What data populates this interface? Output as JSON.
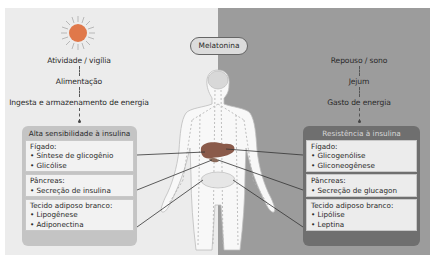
{
  "left_panel": {
    "icon": "sun-icon",
    "labels": [
      "Atividade / vigília",
      "Alimentação",
      "Ingesta e armazenamento de energia"
    ],
    "group": {
      "title": "Alta sensibilidade à insulina",
      "boxes": [
        {
          "heading": "Fígado:",
          "items": [
            "Síntese de glicogênio",
            "Glicólise"
          ]
        },
        {
          "heading": "Pâncreas:",
          "items": [
            "Secreção de insulina"
          ]
        },
        {
          "heading": "Tecido adiposo branco:",
          "items": [
            "Lipogênese",
            "Adiponectina"
          ]
        }
      ]
    }
  },
  "center": {
    "hormone_label": "Melatonina",
    "figure": "human-body-icon"
  },
  "right_panel": {
    "icon": "moon-icon",
    "labels": [
      "Repouso / sono",
      "Jejum",
      "Gasto de energia"
    ],
    "group": {
      "title": "Resistência à insulina",
      "boxes": [
        {
          "heading": "Fígado:",
          "items": [
            "Glicogenólise",
            "Gliconeogênese"
          ]
        },
        {
          "heading": "Pâncreas:",
          "items": [
            "Secreção de glucagon"
          ]
        },
        {
          "heading": "Tecido adiposo branco:",
          "items": [
            "Lipólise",
            "Leptina"
          ]
        }
      ]
    }
  },
  "colors": {
    "left_bg": "#ececec",
    "right_bg": "#9c9c9c",
    "sun": "#e0784a",
    "moon": "#ffffff",
    "liver": "#8a5a4a"
  }
}
